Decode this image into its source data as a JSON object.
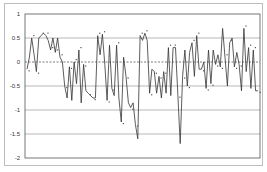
{
  "chart_data": {
    "type": "line",
    "title": "",
    "xlabel": "",
    "ylabel": "",
    "ylim": [
      -2,
      1
    ],
    "yticks": [
      1,
      0.5,
      0,
      -0.5,
      -1,
      -1.5,
      -2
    ],
    "ytick_labels": [
      "1",
      "0.5",
      "0",
      "-0.5",
      "-1",
      "-1.5",
      "-2"
    ],
    "grid": {
      "horizontal": true,
      "vertical": false,
      "zero_line_style": "dashed"
    },
    "legend": null,
    "series": [
      {
        "name": "series-1",
        "color": "#333333",
        "values": [
          -0.15,
          0.1,
          0.5,
          0.15,
          -0.2,
          0.5,
          0.55,
          0.6,
          0.55,
          0.45,
          0.25,
          0.5,
          0.2,
          0.5,
          0.1,
          0.0,
          -0.5,
          -0.75,
          -0.1,
          -0.8,
          0.0,
          -0.45,
          0.25,
          -0.85,
          -0.05,
          -0.6,
          -0.65,
          -0.7,
          -0.75,
          -0.75,
          0.55,
          0.15,
          0.58,
          -0.05,
          -0.8,
          0.35,
          -0.55,
          -0.7,
          0.35,
          -0.75,
          -1.25,
          0.1,
          -0.3,
          -0.85,
          -0.95,
          -0.85,
          -1.3,
          -1.6,
          0.55,
          0.45,
          0.6,
          0.45,
          -0.65,
          -0.15,
          -0.2,
          -0.65,
          -0.3,
          -0.75,
          -0.2,
          -0.65,
          0.3,
          -0.7,
          0.3,
          0.3,
          -0.7,
          -1.7,
          -0.3,
          0.25,
          -0.5,
          0.2,
          0.4,
          -0.3,
          0.55,
          -0.15,
          -0.15,
          0.0,
          -0.55,
          0.25,
          -0.45,
          0.25,
          -0.05,
          0.15,
          -0.1,
          0.7,
          0.1,
          -0.5,
          0.4,
          0.5,
          -0.1,
          0.2,
          -0.05,
          -0.6,
          0.7,
          -0.2,
          0.3,
          -0.55,
          0.25,
          -0.6,
          -0.6
        ]
      }
    ]
  }
}
